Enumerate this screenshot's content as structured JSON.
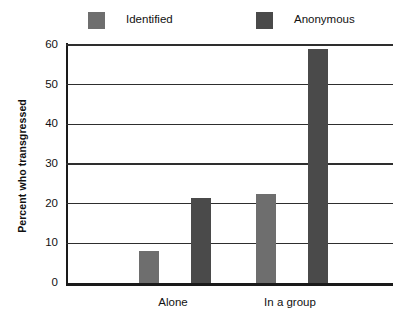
{
  "chart_data": {
    "type": "bar",
    "title": "",
    "xlabel": "",
    "ylabel": "Percent who transgressed",
    "categories": [
      "Alone",
      "In a group"
    ],
    "series": [
      {
        "name": "Identified",
        "color": "#6e6e6e",
        "values": [
          8,
          22.5
        ]
      },
      {
        "name": "Anonymous",
        "color": "#4a4a4a",
        "values": [
          21.5,
          59
        ]
      }
    ],
    "ylim": [
      0,
      60
    ],
    "yticks": [
      0,
      10,
      20,
      30,
      40,
      50,
      60
    ],
    "ytick_labels": [
      "0",
      "10",
      "20",
      "30",
      "40",
      "50",
      "60"
    ],
    "grid": true,
    "grid_axis": "y",
    "legend_position": "top"
  },
  "legend": {
    "entries": [
      {
        "label": "Identified",
        "swatch": "legend-swatch-identified"
      },
      {
        "label": "Anonymous",
        "swatch": "legend-swatch-anonymous"
      }
    ]
  },
  "colors": {
    "identified": "#6e6e6e",
    "anonymous": "#4a4a4a",
    "axis": "#1a1a1a",
    "grid": "#2e2e2e",
    "background": "#ffffff",
    "text": "#111111"
  }
}
